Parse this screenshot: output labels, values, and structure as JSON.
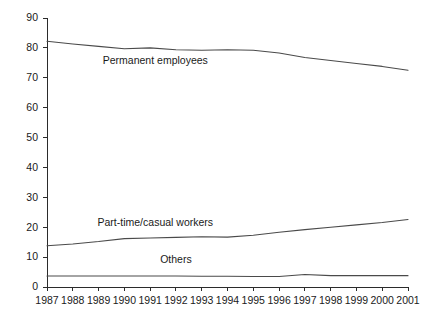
{
  "chart_data": {
    "type": "line",
    "title": "",
    "subtitle": "",
    "xlabel": "",
    "ylabel": "",
    "categories": [
      "1987",
      "1988",
      "1989",
      "1990",
      "1991",
      "1992",
      "1993",
      "1994",
      "1995",
      "1996",
      "1997",
      "1998",
      "1999",
      "2000",
      "2001"
    ],
    "x": [
      1987,
      1988,
      1989,
      1990,
      1991,
      1992,
      1993,
      1994,
      1995,
      1996,
      1997,
      1998,
      1999,
      2000,
      2001
    ],
    "ylim": [
      0,
      90
    ],
    "xlim": [
      1987,
      2001
    ],
    "yticks": [
      0,
      10,
      20,
      30,
      40,
      50,
      60,
      70,
      80,
      90
    ],
    "ytick_labels": [
      "0",
      "10",
      "20",
      "30",
      "40",
      "50",
      "60",
      "70",
      "80",
      "90"
    ],
    "xtick_labels": [
      "1987",
      "1988",
      "1989",
      "1990",
      "1991",
      "1992",
      "1993",
      "1994",
      "1995",
      "1996",
      "1997",
      "1998",
      "1999",
      "2000",
      "2001"
    ],
    "grid": false,
    "legend_position": "inline-labels",
    "series": [
      {
        "name": "Permanent employees",
        "label": "Permanent employees",
        "color": "#4a4a4a",
        "values": [
          82.2,
          81.3,
          80.5,
          79.7,
          80.0,
          79.4,
          79.2,
          79.4,
          79.2,
          78.3,
          76.8,
          75.8,
          74.8,
          73.8,
          72.5
        ]
      },
      {
        "name": "Part-time/casual workers",
        "label": "Part-time/casual workers",
        "color": "#4a4a4a",
        "values": [
          13.8,
          14.4,
          15.2,
          16.2,
          16.4,
          16.6,
          16.8,
          16.7,
          17.3,
          18.3,
          19.2,
          20.0,
          20.8,
          21.6,
          22.6
        ]
      },
      {
        "name": "Others",
        "label": "Others",
        "color": "#4a4a4a",
        "values": [
          3.7,
          3.7,
          3.7,
          3.7,
          3.7,
          3.7,
          3.6,
          3.6,
          3.5,
          3.5,
          4.2,
          3.8,
          3.8,
          3.8,
          3.8
        ]
      }
    ],
    "annotations": [
      {
        "text": "Permanent employees",
        "x": 1991.2,
        "y": 74.5
      },
      {
        "text": "Part-time/casual workers",
        "x": 1991.2,
        "y": 20.3
      },
      {
        "text": "Others",
        "x": 1992.0,
        "y": 8.0
      }
    ]
  },
  "axes": {
    "y_axis_name": "value-axis",
    "x_axis_name": "year-axis"
  }
}
